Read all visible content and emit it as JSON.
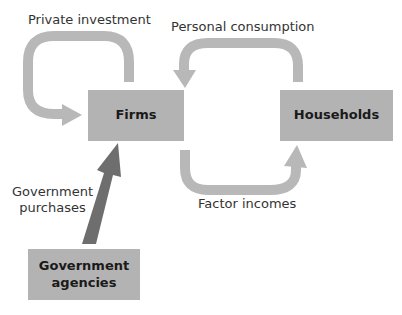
{
  "diagram": {
    "nodes": {
      "firms": {
        "label": "Firms"
      },
      "households": {
        "label": "Households"
      },
      "government_line1": "Government",
      "government_line2": "agencies"
    },
    "flows": {
      "private_investment": "Private investment",
      "personal_consumption": "Personal consumption",
      "factor_incomes": "Factor incomes",
      "government_purchases_line1": "Government",
      "government_purchases_line2": "purchases"
    },
    "colors": {
      "box_fill": "#b3b3b3",
      "light_arrow": "#b8b8b8",
      "dark_arrow": "#6e6e6e",
      "text": "#333333"
    }
  }
}
